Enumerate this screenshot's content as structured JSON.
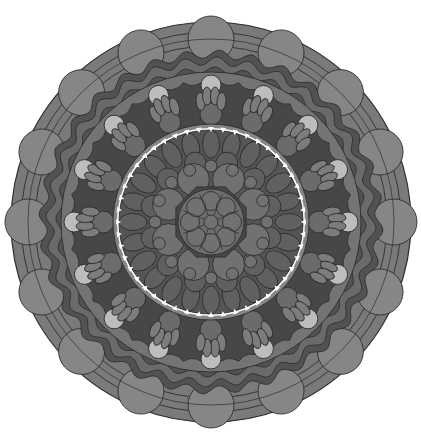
{
  "image": {
    "subject": "grayscale mandala",
    "width": 421,
    "height": 444
  },
  "mandala": {
    "center": [
      211,
      222
    ],
    "outer_radius": 200,
    "colors": {
      "outer_ring": "#7a7a7a",
      "outer_bead": "#868686",
      "wave_dark": "#525252",
      "wave_mid": "#6a6a6a",
      "mid_band": "#747474",
      "scallop_dark": "#474747",
      "petal_light": "#7c7c7c",
      "petal_mid": "#6b6b6b",
      "bead_light": "#bdbdbd",
      "inner_bg": "#555555",
      "inner_petal": "#606060",
      "inner_circle": "#717171",
      "core": "#6e6e6e",
      "stroke": "#2e2e2e",
      "white_dot": "#ffffff"
    },
    "rings": {
      "outer_bead_count": 16,
      "outer_bead_radius": 183,
      "outer_bead_size": 23,
      "wave_outer": 168,
      "wave_inner": 152,
      "wave_count": 32,
      "bead_ring_radius": 146,
      "bead_count": 16,
      "bead_size": 10,
      "scallop_outer": 150,
      "scallop_inner": 98,
      "scallop_count": 16,
      "finger_count": 16,
      "inner_boundary": 96,
      "white_dot_count": 48,
      "inner_petal_count": 24,
      "core_ring_radius": 50,
      "core_circle_count": 8,
      "center_circle_count": 8
    }
  }
}
